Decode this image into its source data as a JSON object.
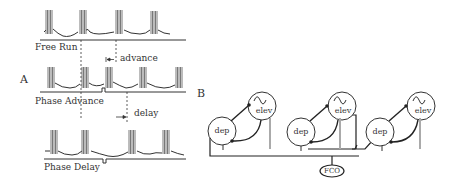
{
  "panel_a": {
    "label": "A",
    "traces": [
      {
        "name": "Free Run",
        "label": "Free Run",
        "bursts_x": [
          46,
          80,
          117,
          152
        ]
      },
      {
        "name": "Phase Advance",
        "label": "Phase Advance",
        "bursts_x": [
          48,
          82,
          106,
          140,
          177
        ]
      },
      {
        "name": "Phase Delay",
        "label": "Phase Delay",
        "bursts_x": [
          51,
          84,
          130,
          164
        ]
      }
    ],
    "annotations": {
      "advance": "advance",
      "delay": "delay"
    }
  },
  "panel_b": {
    "label": "B",
    "units": [
      {
        "dep": "dep",
        "elev": "elev"
      },
      {
        "dep": "dep",
        "elev": "elev"
      },
      {
        "dep": "dep",
        "elev": "elev"
      }
    ],
    "shared_node": "FCO"
  },
  "colors": {
    "ink": "#222222",
    "burst": "#555555",
    "gray_bar": "#aaaaaa",
    "background": "#ffffff"
  }
}
